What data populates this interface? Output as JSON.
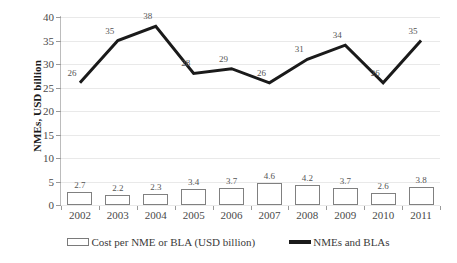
{
  "chart_data": {
    "type": "bar",
    "title": "",
    "xlabel": "",
    "ylabel": "NMEs, USD billion",
    "ylim": [
      0,
      40
    ],
    "yticks": [
      0,
      5,
      10,
      15,
      20,
      25,
      30,
      35,
      40
    ],
    "grid": true,
    "legend_position": "bottom",
    "categories": [
      "2002",
      "2003",
      "2004",
      "2005",
      "2006",
      "2007",
      "2008",
      "2009",
      "2010",
      "2011"
    ],
    "series": [
      {
        "name": "Cost per NME or BLA (USD billion)",
        "type": "bar",
        "values": [
          2.7,
          2.2,
          2.3,
          3.4,
          3.7,
          4.6,
          4.2,
          3.7,
          2.6,
          3.8
        ],
        "labels": [
          "2.7",
          "2.2",
          "2.3",
          "3.4",
          "3.7",
          "4.6",
          "4.2",
          "3.7",
          "2.6",
          "3.8"
        ],
        "fill_color": "#ffffff",
        "edge_color": "#808080"
      },
      {
        "name": "NMEs and BLAs",
        "type": "line",
        "values": [
          26,
          35,
          38,
          28,
          29,
          26,
          31,
          34,
          26,
          35
        ],
        "labels": [
          "26",
          "35",
          "38",
          "28",
          "29",
          "26",
          "31",
          "34",
          "26",
          "35"
        ],
        "line_color": "#1a1a1a",
        "line_width": 3
      }
    ]
  },
  "legend": {
    "items": [
      {
        "label": "Cost per NME or BLA (USD billion)",
        "marker": "bar-swatch"
      },
      {
        "label": "NMEs and BLAs",
        "marker": "line-swatch"
      }
    ]
  },
  "axis": {
    "y_title": "NMEs, USD billion",
    "y_tick_labels": [
      "0",
      "5",
      "10",
      "15",
      "20",
      "25",
      "30",
      "35",
      "40"
    ],
    "x_tick_labels": [
      "2002",
      "2003",
      "2004",
      "2005",
      "2006",
      "2007",
      "2008",
      "2009",
      "2010",
      "2011"
    ]
  },
  "colors": {
    "gridline": "#e9e9e9",
    "axis": "#9a9a9a",
    "line_series": "#1a1a1a",
    "bar_edge": "#808080",
    "text": "#4a4a4a"
  }
}
